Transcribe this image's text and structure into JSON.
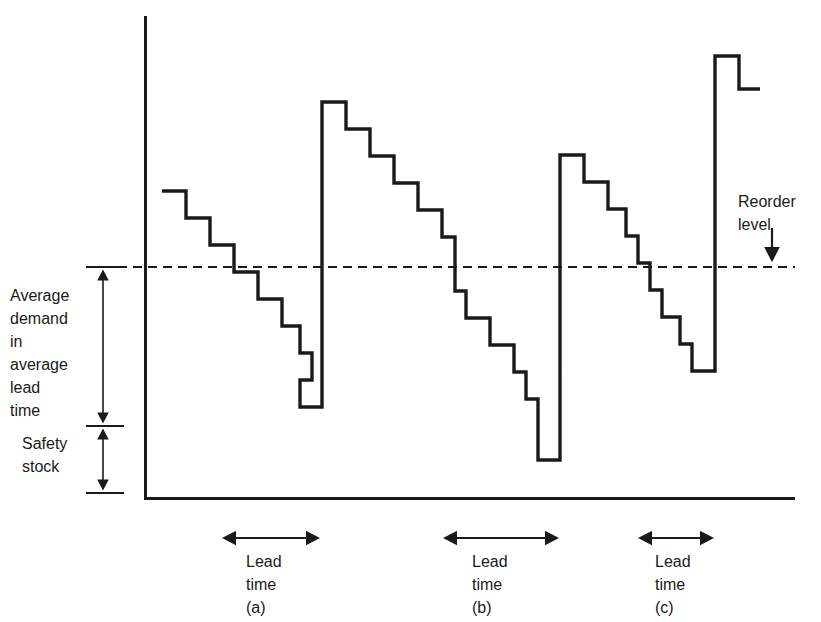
{
  "chart_data": {
    "type": "line",
    "title": "",
    "xlabel": "Time",
    "ylabel": "Stock level",
    "grid": false,
    "legend_position": "none",
    "axes": {
      "x_axis_y": 498,
      "y_axis_x": 145,
      "y_axis_top": 16,
      "x_axis_right": 795
    },
    "reorder_level": {
      "label_line1": "Reorder",
      "label_line2": "level",
      "y": 267,
      "line_style": "dashed",
      "x_start": 103,
      "x_end": 795,
      "dash_length": 9,
      "dash_gap": 6,
      "arrow": {
        "x": 772,
        "y_start": 228,
        "y_end": 263
      }
    },
    "left_annotations": {
      "average_demand": {
        "lines": [
          "Average",
          "demand",
          "in",
          "average",
          "lead",
          "time"
        ],
        "arrow_x": 103,
        "top_y": 267,
        "bottom_y": 426,
        "tick_x_start": 86,
        "tick_x_end": 124
      },
      "safety_stock": {
        "lines": [
          "Safety",
          "stock"
        ],
        "arrow_x": 103,
        "top_y": 426,
        "bottom_y": 493,
        "tick_x_start": 86,
        "tick_x_end": 124
      }
    },
    "lead_time_markers": [
      {
        "label_line1": "Lead",
        "label_line2": "time",
        "label_line3": "(a)",
        "x_start": 222,
        "x_end": 320,
        "y": 538
      },
      {
        "label_line1": "Lead",
        "label_line2": "time",
        "label_line3": "(b)",
        "x_start": 443,
        "x_end": 559,
        "y": 538
      },
      {
        "label_line1": "Lead",
        "label_line2": "time",
        "label_line3": "(c)",
        "x_start": 638,
        "x_end": 714,
        "y": 538
      }
    ],
    "sawtooth_points": [
      [
        162,
        191
      ],
      [
        186,
        191
      ],
      [
        186,
        218
      ],
      [
        210,
        218
      ],
      [
        210,
        245
      ],
      [
        234,
        245
      ],
      [
        234,
        272
      ],
      [
        258,
        272
      ],
      [
        258,
        299
      ],
      [
        282,
        299
      ],
      [
        282,
        326
      ],
      [
        300,
        326
      ],
      [
        300,
        353
      ],
      [
        312,
        353
      ],
      [
        312,
        380
      ],
      [
        300,
        380
      ],
      [
        300,
        407
      ],
      [
        322,
        407
      ],
      [
        322,
        102
      ],
      [
        346,
        102
      ],
      [
        346,
        129
      ],
      [
        370,
        129
      ],
      [
        370,
        156
      ],
      [
        394,
        156
      ],
      [
        394,
        183
      ],
      [
        418,
        183
      ],
      [
        418,
        210
      ],
      [
        442,
        210
      ],
      [
        442,
        237
      ],
      [
        455,
        237
      ],
      [
        455,
        264
      ],
      [
        455,
        291
      ],
      [
        466,
        291
      ],
      [
        466,
        318
      ],
      [
        490,
        318
      ],
      [
        490,
        345
      ],
      [
        514,
        345
      ],
      [
        514,
        372
      ],
      [
        526,
        372
      ],
      [
        526,
        399
      ],
      [
        538,
        399
      ],
      [
        538,
        426
      ],
      [
        538,
        460
      ],
      [
        560,
        460
      ],
      [
        560,
        155
      ],
      [
        584,
        155
      ],
      [
        584,
        182
      ],
      [
        608,
        182
      ],
      [
        608,
        209
      ],
      [
        626,
        209
      ],
      [
        626,
        236
      ],
      [
        638,
        236
      ],
      [
        638,
        263
      ],
      [
        650,
        263
      ],
      [
        650,
        290
      ],
      [
        662,
        290
      ],
      [
        662,
        317
      ],
      [
        680,
        317
      ],
      [
        680,
        344
      ],
      [
        692,
        344
      ],
      [
        692,
        371
      ],
      [
        715,
        371
      ],
      [
        715,
        56
      ],
      [
        739,
        56
      ],
      [
        739,
        89
      ],
      [
        760,
        89
      ]
    ],
    "series_description": "Stock level sawtooth: stepped depletion then instant replenishment at each reorder point"
  },
  "annotations": {
    "avg_demand_text": "Average\ndemand\nin\naverage\nlead\ntime",
    "safety_stock_text": "Safety\nstock",
    "reorder_text": "Reorder\nlevel",
    "lead_a_text": "Lead\ntime\n(a)",
    "lead_b_text": "Lead\ntime\n(b)",
    "lead_c_text": "Lead\ntime\n(c)"
  },
  "colors": {
    "ink": "#1a1a1a",
    "line": "#1a1a1a",
    "background": "#ffffff"
  }
}
